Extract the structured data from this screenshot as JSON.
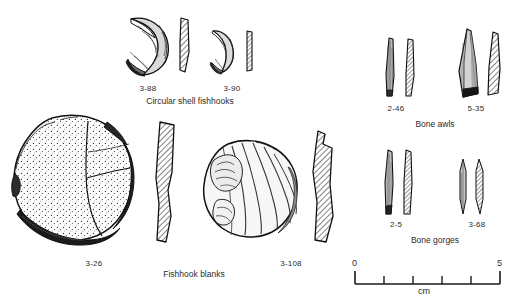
{
  "plate": {
    "background": "#ffffff",
    "ink": "#1a1a1a",
    "title_present": false
  },
  "groups": [
    {
      "id": "circular-shell-fishhooks",
      "label": "Circular shell fishhooks",
      "label_x": 190,
      "label_y": 100,
      "specimens": [
        {
          "catalog": "3-88",
          "label_x": 148,
          "label_y": 88
        },
        {
          "catalog": "3-90",
          "label_x": 232,
          "label_y": 88
        }
      ]
    },
    {
      "id": "fishhook-blanks",
      "label": "Fishhook blanks",
      "label_x": 194,
      "label_y": 273,
      "specimens": [
        {
          "catalog": "3-26",
          "label_x": 94,
          "label_y": 263
        },
        {
          "catalog": "3-108",
          "label_x": 289,
          "label_y": 263
        }
      ]
    },
    {
      "id": "bone-awls",
      "label": "Bone awls",
      "label_x": 435,
      "label_y": 123,
      "specimens": [
        {
          "catalog": "2-46",
          "label_x": 396,
          "label_y": 108
        },
        {
          "catalog": "5-35",
          "label_x": 476,
          "label_y": 108
        }
      ]
    },
    {
      "id": "bone-gorges",
      "label": "Bone gorges",
      "label_x": 435,
      "label_y": 239,
      "specimens": [
        {
          "catalog": "2-5",
          "label_x": 396,
          "label_y": 224
        },
        {
          "catalog": "3-68",
          "label_x": 477,
          "label_y": 224
        }
      ]
    }
  ],
  "scale_bar": {
    "start_label": "0",
    "end_label": "5",
    "unit_label": "cm",
    "x_start": 355,
    "x_end": 500,
    "y_baseline": 284,
    "major_ticks": 5,
    "tick_positions": [
      355,
      384,
      413,
      442,
      471,
      500
    ]
  }
}
